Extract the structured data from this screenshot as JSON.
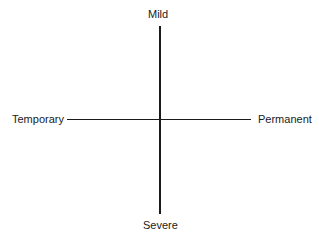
{
  "diagram": {
    "type": "two-axis quadrant diagram",
    "vertical_axis": {
      "top_label": "Mild",
      "bottom_label": "Severe"
    },
    "horizontal_axis": {
      "left_label": "Temporary",
      "right_label": "Permanent"
    },
    "line_color": "#1a1a1a",
    "background": "#ffffff"
  }
}
